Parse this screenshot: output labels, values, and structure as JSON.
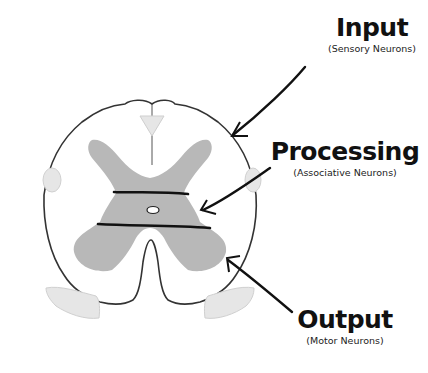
{
  "diagram": {
    "colors": {
      "outline": "#333333",
      "gray_matter": "#b8b8b8",
      "tracts": "#e6e6e6",
      "bands": "#111111",
      "arrows": "#111111",
      "background": "#ffffff"
    },
    "labels": [
      {
        "id": "input",
        "title": "Input",
        "subtitle": "(Sensory Neurons)"
      },
      {
        "id": "processing",
        "title": "Processing",
        "subtitle": "(Associative Neurons)"
      },
      {
        "id": "output",
        "title": "Output",
        "subtitle": "(Motor Neurons)"
      }
    ]
  }
}
